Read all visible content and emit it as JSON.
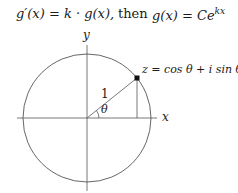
{
  "formula": {
    "lhs": "g′(x) = k · g(x),",
    "connector": "then",
    "rhs_base": "g(x) = Ce",
    "rhs_exp": "kx"
  },
  "diagram": {
    "x_axis_label": "x",
    "y_axis_label": "y",
    "radius_label": "1",
    "angle_label": "θ",
    "point_label": "z = cos θ + i sin θ",
    "colors": {
      "stroke": "#555555",
      "text": "#1a1a1a",
      "point": "#111111"
    }
  }
}
